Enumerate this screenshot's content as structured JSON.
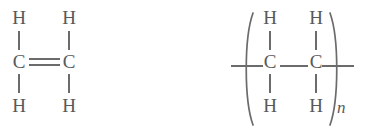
{
  "figure": {
    "background_color": "#ffffff",
    "stroke_color": "#6b6b6b",
    "text_color": "#595959"
  },
  "monomer": {
    "name": "ethylene",
    "atoms": {
      "h_top_left": "H",
      "h_top_right": "H",
      "c_left": "C",
      "c_right": "C",
      "h_bottom_left": "H",
      "h_bottom_right": "H"
    },
    "bond_type": "double"
  },
  "polymer": {
    "name": "polyethylene-repeat-unit",
    "atoms": {
      "h_top_left": "H",
      "h_top_right": "H",
      "c_left": "C",
      "c_right": "C",
      "h_bottom_left": "H",
      "h_bottom_right": "H"
    },
    "bond_type": "single",
    "repeat_subscript": "n",
    "bracket_left": "(",
    "bracket_right": ")"
  }
}
